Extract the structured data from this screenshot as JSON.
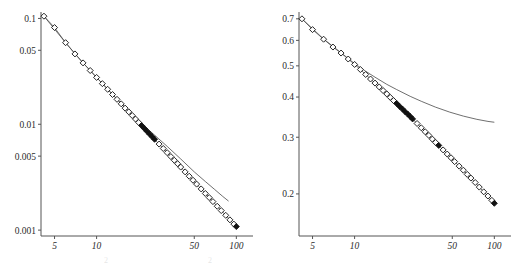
{
  "figure": {
    "name": "two-panel-log-log-scaling-figure",
    "panel_count": 2,
    "background_color": "#ffffff",
    "marker_color": "#111111",
    "curve_color": "#4a4a4a"
  },
  "ghost_caption": {
    "fragment_a": "2",
    "fragment_b": "2"
  },
  "chart_data": [
    {
      "type": "scatter",
      "name": "left-panel",
      "title": "",
      "xlabel": "",
      "ylabel": "",
      "xscale": "log",
      "yscale": "log",
      "xlim": [
        4.0,
        108.0
      ],
      "ylim": [
        0.00088,
        0.115
      ],
      "grid": false,
      "legend": "none",
      "xticks": [
        5,
        10,
        50,
        100
      ],
      "xtick_labels": [
        "5",
        "10",
        "50",
        "100"
      ],
      "yticks": [
        0.1,
        0.05,
        0.01,
        0.005,
        0.001
      ],
      "ytick_labels": [
        "0.1",
        "0.05",
        "0.01",
        "0.005",
        "0.001"
      ],
      "series": [
        {
          "name": "data-markers",
          "style": "open-diamond",
          "x": [
            4.2,
            5.0,
            6.0,
            7.0,
            8.0,
            9.0,
            10.0,
            11.0,
            12.0,
            13.0,
            14.0,
            15.0,
            16.0,
            17.0,
            18.0,
            19.0,
            20.0,
            21.0,
            22.0,
            23.0,
            24.0,
            25.0,
            26.0,
            28.0,
            30.0,
            32.0,
            34.0,
            36.0,
            38.0,
            40.0,
            43.0,
            46.0,
            49.0,
            52.0,
            56.0,
            60.0,
            64.0,
            68.0,
            73.0,
            78.0,
            84.0,
            90.0,
            96.0,
            100.0
          ],
          "y": [
            0.105,
            0.082,
            0.059,
            0.0462,
            0.038,
            0.0322,
            0.0277,
            0.0242,
            0.0214,
            0.0191,
            0.0172,
            0.0156,
            0.0142,
            0.0131,
            0.0121,
            0.0112,
            0.0104,
            0.00972,
            0.00911,
            0.00856,
            0.00807,
            0.00762,
            0.00721,
            0.0065,
            0.0059,
            0.00539,
            0.00495,
            0.00457,
            0.00424,
            0.00394,
            0.00355,
            0.00323,
            0.00296,
            0.00272,
            0.00245,
            0.00222,
            0.00203,
            0.00186,
            0.00168,
            0.00153,
            0.00138,
            0.00125,
            0.00114,
            0.00108
          ]
        },
        {
          "name": "theory-curve",
          "style": "thin-line",
          "x": [
            4.2,
            6.0,
            8.0,
            10.0,
            14.0,
            18.0,
            22.0,
            26.0,
            32.0,
            40.0,
            50.0,
            60.0,
            70.0,
            80.0,
            88.0
          ],
          "y": [
            0.105,
            0.059,
            0.038,
            0.0277,
            0.0173,
            0.0123,
            0.0096,
            0.0079,
            0.00618,
            0.0047,
            0.00355,
            0.00288,
            0.00242,
            0.00208,
            0.00188
          ]
        }
      ]
    },
    {
      "type": "scatter",
      "name": "right-panel",
      "title": "",
      "xlabel": "",
      "ylabel": "",
      "xscale": "log",
      "yscale": "log",
      "xlim": [
        4.0,
        108.0
      ],
      "ylim": [
        0.148,
        0.735
      ],
      "grid": false,
      "legend": "none",
      "xticks": [
        5,
        10,
        50,
        100
      ],
      "xtick_labels": [
        "5",
        "10",
        "50",
        "100"
      ],
      "yticks": [
        0.7,
        0.6,
        0.5,
        0.4,
        0.3,
        0.2
      ],
      "ytick_labels": [
        "0.7",
        "0.6",
        "0.5",
        "0.4",
        "0.3",
        "0.2"
      ],
      "series": [
        {
          "name": "data-markers",
          "style": "open-diamond",
          "x": [
            4.2,
            5.0,
            6.0,
            7.0,
            8.0,
            9.0,
            10.0,
            11.0,
            12.0,
            13.0,
            14.0,
            15.0,
            16.0,
            17.0,
            18.0,
            19.0,
            20.0,
            21.0,
            22.0,
            23.0,
            24.0,
            25.0,
            26.0,
            28.0,
            30.0,
            32.0,
            34.0,
            36.0,
            38.0,
            40.0,
            43.0,
            46.0,
            49.0,
            52.0,
            56.0,
            60.0,
            64.0,
            68.0,
            73.0,
            78.0,
            84.0,
            90.0,
            96.0,
            100.0
          ],
          "y": [
            0.7,
            0.648,
            0.605,
            0.572,
            0.548,
            0.525,
            0.505,
            0.487,
            0.47,
            0.455,
            0.442,
            0.43,
            0.419,
            0.409,
            0.399,
            0.39,
            0.382,
            0.374,
            0.367,
            0.36,
            0.354,
            0.348,
            0.342,
            0.331,
            0.321,
            0.312,
            0.304,
            0.296,
            0.289,
            0.283,
            0.274,
            0.266,
            0.259,
            0.252,
            0.244,
            0.237,
            0.23,
            0.224,
            0.217,
            0.21,
            0.203,
            0.197,
            0.191,
            0.187
          ]
        },
        {
          "name": "theory-curve",
          "style": "thin-line",
          "x": [
            4.2,
            6.0,
            8.0,
            10.0,
            12.0,
            14.0,
            17.0,
            20.0,
            25.0,
            30.0,
            38.0,
            48.0,
            60.0,
            75.0,
            90.0,
            100.0
          ],
          "y": [
            0.7,
            0.606,
            0.549,
            0.508,
            0.481,
            0.461,
            0.438,
            0.422,
            0.402,
            0.388,
            0.372,
            0.359,
            0.349,
            0.341,
            0.336,
            0.334
          ]
        }
      ]
    }
  ]
}
